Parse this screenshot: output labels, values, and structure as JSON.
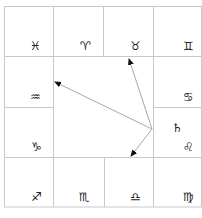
{
  "chart": {
    "type": "south-indian-style zodiac grid",
    "grid_color": "#c8c8c8",
    "arrow_color": "#a0a0a0",
    "signs": [
      {
        "name": "pisces",
        "glyph": "♓︎",
        "x": 30,
        "y": 40
      },
      {
        "name": "aries",
        "glyph": "♈︎",
        "x": 80,
        "y": 40
      },
      {
        "name": "taurus",
        "glyph": "♉︎",
        "x": 130,
        "y": 40
      },
      {
        "name": "gemini",
        "glyph": "♊︎",
        "x": 183,
        "y": 40
      },
      {
        "name": "cancer",
        "glyph": "♋︎",
        "x": 183,
        "y": 91
      },
      {
        "name": "leo",
        "glyph": "♌︎",
        "x": 183,
        "y": 141
      },
      {
        "name": "virgo",
        "glyph": "♍︎",
        "x": 183,
        "y": 191
      },
      {
        "name": "libra",
        "glyph": "♎︎",
        "x": 130,
        "y": 191
      },
      {
        "name": "scorpio",
        "glyph": "♏︎",
        "x": 79,
        "y": 191
      },
      {
        "name": "sagittarius",
        "glyph": "♐︎",
        "x": 31,
        "y": 191
      },
      {
        "name": "capricorn",
        "glyph": "♑︎",
        "x": 31,
        "y": 141
      },
      {
        "name": "aquarius",
        "glyph": "♒︎",
        "x": 30,
        "y": 91
      }
    ],
    "planets": [
      {
        "name": "saturn",
        "glyph": "♄",
        "sign": "leo",
        "x": 172,
        "y": 122
      }
    ],
    "aspect_origin": {
      "x": 152,
      "y": 129
    },
    "arrows": [
      {
        "to_x": 54,
        "to_y": 82
      },
      {
        "to_x": 128,
        "to_y": 58
      },
      {
        "to_x": 130,
        "to_y": 157
      }
    ],
    "footer_text": ""
  }
}
